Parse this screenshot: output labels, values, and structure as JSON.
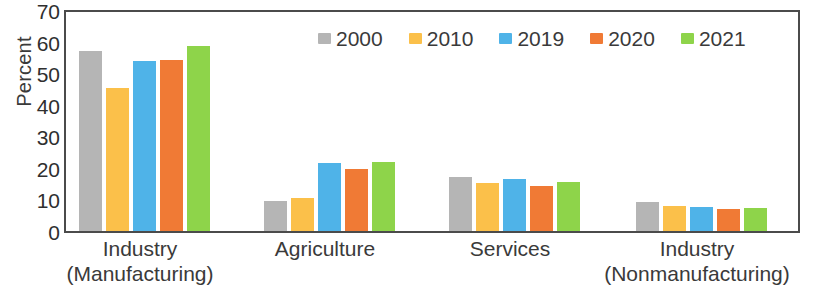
{
  "chart_data": {
    "type": "bar",
    "title": "",
    "xlabel": "",
    "ylabel": "Percent",
    "ylim": [
      0,
      70
    ],
    "ytick_step": 10,
    "yticks": [
      70,
      60,
      50,
      40,
      30,
      20,
      10,
      0
    ],
    "grid": false,
    "legend_position": "top-center",
    "categories": [
      "Industry (Manufacturing)",
      "Agriculture",
      "Services",
      "Industry (Nonmanufacturing)"
    ],
    "category_lines": [
      [
        "Industry",
        "(Manufacturing)"
      ],
      [
        "Agriculture",
        ""
      ],
      [
        "Services",
        ""
      ],
      [
        "Industry",
        "(Nonmanufacturing)"
      ]
    ],
    "series": [
      {
        "name": "2000",
        "color": "#b5b5b5",
        "values": [
          57.0,
          9.5,
          17.2,
          9.3
        ]
      },
      {
        "name": "2010",
        "color": "#fbc04a",
        "values": [
          45.2,
          10.5,
          15.2,
          8.0
        ]
      },
      {
        "name": "2019",
        "color": "#4fb3e8",
        "values": [
          54.0,
          21.5,
          16.5,
          7.5
        ]
      },
      {
        "name": "2020",
        "color": "#f07a35",
        "values": [
          54.3,
          19.5,
          14.3,
          7.0
        ]
      },
      {
        "name": "2021",
        "color": "#8ed44a",
        "values": [
          58.5,
          22.0,
          15.5,
          7.2
        ]
      }
    ]
  }
}
